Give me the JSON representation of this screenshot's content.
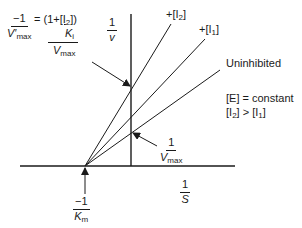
{
  "diagram": {
    "axes": {
      "y_label_num": "1",
      "y_label_den": "v",
      "x_label_num": "1",
      "x_label_den": "S"
    },
    "lines": [
      {
        "label_prefix": "+[I",
        "label_sub": "2",
        "label_suffix": "]"
      },
      {
        "label_prefix": "+[I",
        "label_sub": "1",
        "label_suffix": "]"
      },
      {
        "label": "Uninhibited"
      }
    ],
    "annotations": {
      "vmax_prime": {
        "lhs_num": "−1",
        "lhs_den_main": "V′",
        "lhs_den_sub": "max",
        "eq": "= (1+",
        "inner_num_prefix": "[I",
        "inner_num_sub": "2",
        "inner_num_suffix": "])",
        "inner_den_main": "K",
        "inner_den_sub": "i",
        "outer_den_main": "V",
        "outer_den_sub": "max"
      },
      "vmax": {
        "num": "1",
        "den_main": "V",
        "den_sub": "max"
      },
      "km": {
        "num": "−1",
        "den_main": "K",
        "den_sub": "m"
      }
    },
    "conditions": {
      "line1": "[E] = constant",
      "line2_a": "[I",
      "line2_a_sub": "2",
      "line2_b": "] > [I",
      "line2_b_sub": "1",
      "line2_c": "]"
    },
    "colors": {
      "ink": "#1a1a1a",
      "background": "#ffffff"
    }
  }
}
